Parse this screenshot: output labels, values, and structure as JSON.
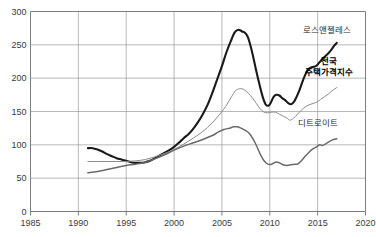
{
  "chart_data": {
    "type": "line",
    "title": "",
    "subtitle": "",
    "xlabel": "",
    "ylabel": "",
    "xlim": [
      1985,
      2020
    ],
    "ylim": [
      0,
      300
    ],
    "grid": true,
    "legend_position": "inline-annotations",
    "x_ticks": [
      "1985",
      "1990",
      "1995",
      "2000",
      "2005",
      "2010",
      "2015",
      "2020"
    ],
    "y_ticks": [
      "0",
      "50",
      "100",
      "150",
      "200",
      "250",
      "300"
    ],
    "series": [
      {
        "name": "로스앤젤레스",
        "color": "#1a1a1a",
        "width": 2.1,
        "label_x": 2016.0,
        "label_y": 268,
        "bold": false,
        "points": [
          [
            1991.0,
            95
          ],
          [
            1991.5,
            95
          ],
          [
            1992.0,
            93
          ],
          [
            1992.5,
            90
          ],
          [
            1993.0,
            86
          ],
          [
            1993.5,
            83
          ],
          [
            1994.0,
            80
          ],
          [
            1994.5,
            78
          ],
          [
            1995.0,
            76
          ],
          [
            1995.5,
            74
          ],
          [
            1996.0,
            73
          ],
          [
            1996.5,
            73
          ],
          [
            1997.0,
            74
          ],
          [
            1997.5,
            76
          ],
          [
            1998.0,
            80
          ],
          [
            1998.5,
            84
          ],
          [
            1999.0,
            88
          ],
          [
            1999.5,
            92
          ],
          [
            2000.0,
            97
          ],
          [
            2000.5,
            103
          ],
          [
            2001.0,
            110
          ],
          [
            2001.5,
            116
          ],
          [
            2002.0,
            124
          ],
          [
            2002.5,
            134
          ],
          [
            2003.0,
            146
          ],
          [
            2003.5,
            160
          ],
          [
            2004.0,
            178
          ],
          [
            2004.5,
            198
          ],
          [
            2005.0,
            218
          ],
          [
            2005.5,
            240
          ],
          [
            2006.0,
            258
          ],
          [
            2006.3,
            268
          ],
          [
            2006.6,
            272
          ],
          [
            2006.9,
            272
          ],
          [
            2007.1,
            270
          ],
          [
            2007.4,
            268
          ],
          [
            2007.7,
            262
          ],
          [
            2008.0,
            248
          ],
          [
            2008.3,
            230
          ],
          [
            2008.6,
            210
          ],
          [
            2009.0,
            186
          ],
          [
            2009.3,
            170
          ],
          [
            2009.6,
            160
          ],
          [
            2009.9,
            159
          ],
          [
            2010.1,
            163
          ],
          [
            2010.4,
            172
          ],
          [
            2010.7,
            175
          ],
          [
            2011.0,
            174
          ],
          [
            2011.3,
            170
          ],
          [
            2011.6,
            167
          ],
          [
            2011.9,
            163
          ],
          [
            2012.2,
            161
          ],
          [
            2012.5,
            164
          ],
          [
            2012.8,
            172
          ],
          [
            2013.1,
            182
          ],
          [
            2013.4,
            194
          ],
          [
            2013.7,
            205
          ],
          [
            2014.0,
            213
          ],
          [
            2014.3,
            216
          ],
          [
            2014.6,
            217
          ],
          [
            2014.9,
            219
          ],
          [
            2015.2,
            224
          ],
          [
            2015.5,
            229
          ],
          [
            2015.8,
            233
          ],
          [
            2016.1,
            237
          ],
          [
            2016.4,
            242
          ],
          [
            2016.7,
            248
          ],
          [
            2017.0,
            253
          ]
        ]
      },
      {
        "name": "전국 주택가격지수",
        "color": "#8a8a8a",
        "width": 1.0,
        "label_x": 2016.2,
        "label_y": 222,
        "bold": true,
        "points": [
          [
            1991.0,
            75
          ],
          [
            1992.0,
            75
          ],
          [
            1993.0,
            75
          ],
          [
            1994.0,
            75
          ],
          [
            1995.0,
            75
          ],
          [
            1996.0,
            76
          ],
          [
            1997.0,
            78
          ],
          [
            1998.0,
            82
          ],
          [
            1999.0,
            87
          ],
          [
            2000.0,
            93
          ],
          [
            2001.0,
            101
          ],
          [
            2002.0,
            110
          ],
          [
            2003.0,
            120
          ],
          [
            2004.0,
            133
          ],
          [
            2005.0,
            150
          ],
          [
            2005.5,
            160
          ],
          [
            2006.0,
            172
          ],
          [
            2006.4,
            181
          ],
          [
            2006.8,
            184
          ],
          [
            2007.1,
            184
          ],
          [
            2007.4,
            182
          ],
          [
            2007.8,
            177
          ],
          [
            2008.2,
            170
          ],
          [
            2008.6,
            162
          ],
          [
            2009.0,
            154
          ],
          [
            2009.4,
            149
          ],
          [
            2009.8,
            148
          ],
          [
            2010.2,
            149
          ],
          [
            2010.6,
            149
          ],
          [
            2011.0,
            146
          ],
          [
            2011.4,
            143
          ],
          [
            2011.8,
            140
          ],
          [
            2012.1,
            137
          ],
          [
            2012.5,
            140
          ],
          [
            2012.9,
            146
          ],
          [
            2013.3,
            152
          ],
          [
            2013.7,
            157
          ],
          [
            2014.1,
            160
          ],
          [
            2014.5,
            162
          ],
          [
            2014.9,
            164
          ],
          [
            2015.3,
            168
          ],
          [
            2015.7,
            172
          ],
          [
            2016.1,
            176
          ],
          [
            2016.5,
            181
          ],
          [
            2017.0,
            186
          ]
        ]
      },
      {
        "name": "디트로이트",
        "color": "#6a6a6a",
        "width": 1.5,
        "label_x": 2015.0,
        "label_y": 128,
        "bold": false,
        "points": [
          [
            1991.0,
            58
          ],
          [
            1992.0,
            60
          ],
          [
            1993.0,
            63
          ],
          [
            1994.0,
            66
          ],
          [
            1995.0,
            69
          ],
          [
            1996.0,
            71
          ],
          [
            1997.0,
            74
          ],
          [
            1998.0,
            79
          ],
          [
            1999.0,
            85
          ],
          [
            2000.0,
            92
          ],
          [
            2001.0,
            98
          ],
          [
            2002.0,
            103
          ],
          [
            2003.0,
            108
          ],
          [
            2004.0,
            114
          ],
          [
            2004.6,
            119
          ],
          [
            2005.2,
            123
          ],
          [
            2005.8,
            125
          ],
          [
            2006.2,
            127
          ],
          [
            2006.6,
            127
          ],
          [
            2007.0,
            125
          ],
          [
            2007.4,
            122
          ],
          [
            2007.8,
            118
          ],
          [
            2008.2,
            110
          ],
          [
            2008.6,
            99
          ],
          [
            2009.0,
            86
          ],
          [
            2009.4,
            76
          ],
          [
            2009.8,
            71
          ],
          [
            2010.2,
            71
          ],
          [
            2010.6,
            74
          ],
          [
            2011.0,
            73
          ],
          [
            2011.4,
            70
          ],
          [
            2011.8,
            69
          ],
          [
            2012.2,
            70
          ],
          [
            2012.6,
            71
          ],
          [
            2012.9,
            71
          ],
          [
            2013.3,
            76
          ],
          [
            2013.7,
            83
          ],
          [
            2014.1,
            89
          ],
          [
            2014.5,
            94
          ],
          [
            2014.9,
            97
          ],
          [
            2015.2,
            100
          ],
          [
            2015.5,
            99
          ],
          [
            2015.8,
            101
          ],
          [
            2016.1,
            104
          ],
          [
            2016.5,
            107
          ],
          [
            2017.0,
            109
          ]
        ]
      }
    ]
  }
}
